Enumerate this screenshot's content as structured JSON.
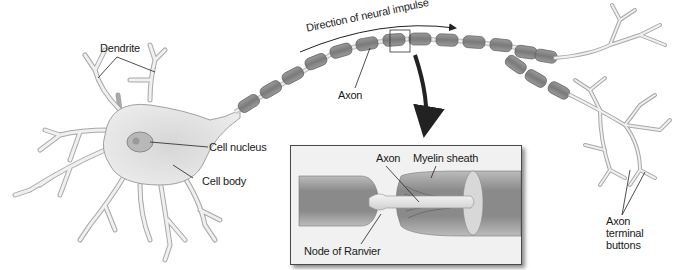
{
  "diagram": {
    "labels": {
      "dendrite": "Dendrite",
      "cell_nucleus": "Cell nucleus",
      "cell_body": "Cell body",
      "axon": "Axon",
      "direction": "Direction of neural impulse",
      "axon_terminal": [
        "Axon",
        "terminal",
        "buttons"
      ]
    },
    "inset": {
      "axon": "Axon",
      "myelin_sheath": "Myelin sheath",
      "node_of_ranvier": "Node of Ranvier"
    },
    "colors": {
      "cell_fill": "#e6e6e6",
      "cell_stroke": "#9a9a9a",
      "myelin": "#8c8c8c",
      "myelin_stroke": "#5e5e5e",
      "inset_bg": "#f1f1f1",
      "text": "#1a1a1a"
    }
  }
}
